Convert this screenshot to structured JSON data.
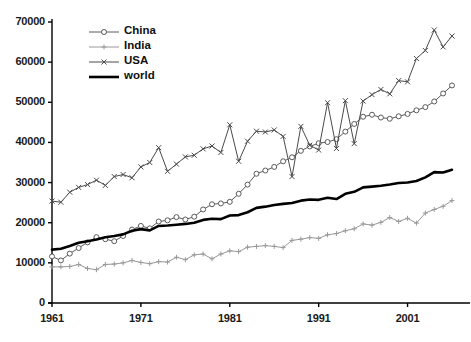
{
  "chart_data": {
    "type": "line",
    "title": "",
    "subtitle": "",
    "xlabel": "",
    "ylabel": "",
    "xlim": [
      1961,
      2006
    ],
    "ylim": [
      0,
      70000
    ],
    "grid": false,
    "legend_position": "top-left",
    "y_ticks": [
      0,
      10000,
      20000,
      30000,
      40000,
      50000,
      60000,
      70000
    ],
    "y_tick_labels": [
      "0",
      "10000",
      "20000",
      "30000",
      "40000",
      "50000",
      "60000",
      "70000"
    ],
    "x_ticks": [
      1961,
      1971,
      1981,
      1991,
      2001
    ],
    "x_tick_labels": [
      "1961",
      "1971",
      "1981",
      "1991",
      "2001"
    ],
    "x": [
      1961,
      1962,
      1963,
      1964,
      1965,
      1966,
      1967,
      1968,
      1969,
      1970,
      1971,
      1972,
      1973,
      1974,
      1975,
      1976,
      1977,
      1978,
      1979,
      1980,
      1981,
      1982,
      1983,
      1984,
      1985,
      1986,
      1987,
      1988,
      1989,
      1990,
      1991,
      1992,
      1993,
      1994,
      1995,
      1996,
      1997,
      1998,
      1999,
      2000,
      2001,
      2002,
      2003,
      2004,
      2005,
      2006
    ],
    "series": [
      {
        "name": "China",
        "marker": "circle-open",
        "color": "#5a5a5a",
        "line_width": 1,
        "values": [
          11600,
          10600,
          12300,
          13700,
          15100,
          16400,
          15900,
          15400,
          16700,
          18300,
          19200,
          18600,
          20300,
          20600,
          21400,
          20800,
          21500,
          23300,
          24600,
          24800,
          25200,
          27200,
          29500,
          32200,
          33000,
          33900,
          35300,
          36300,
          37900,
          39000,
          39800,
          40100,
          40800,
          42700,
          44600,
          46400,
          46900,
          46200,
          45900,
          46500,
          47100,
          48000,
          48800,
          50200,
          52200,
          54200
        ]
      },
      {
        "name": "India",
        "marker": "plus",
        "color": "#999999",
        "line_width": 1,
        "values": [
          9000,
          9000,
          9100,
          9600,
          8600,
          8300,
          9600,
          9700,
          10000,
          10600,
          10100,
          9800,
          10300,
          10200,
          11400,
          10800,
          12000,
          12200,
          11000,
          12200,
          13000,
          12800,
          13900,
          14100,
          14300,
          14100,
          13800,
          15600,
          15900,
          16300,
          16100,
          17000,
          17300,
          18000,
          18500,
          19700,
          19400,
          20100,
          21300,
          20300,
          21100,
          19900,
          22400,
          23300,
          24100,
          25500
        ]
      },
      {
        "name": "USA",
        "marker": "x",
        "color": "#4a4a4a",
        "line_width": 1,
        "values": [
          25400,
          25100,
          27600,
          28800,
          29500,
          30600,
          29300,
          31500,
          32000,
          31200,
          33900,
          35000,
          38700,
          32800,
          34600,
          36400,
          36800,
          38400,
          39100,
          37500,
          44400,
          35300,
          40300,
          42800,
          42600,
          43100,
          41500,
          31500,
          44000,
          39300,
          38100,
          49900,
          38500,
          50400,
          39700,
          50300,
          51900,
          53200,
          52100,
          55400,
          55100,
          60900,
          62900,
          68000,
          63800,
          66500
        ]
      },
      {
        "name": "world",
        "marker": "none",
        "color": "#000000",
        "line_width": 2.6,
        "values": [
          13300,
          13500,
          14200,
          15000,
          15400,
          15800,
          16400,
          16700,
          17100,
          18000,
          18400,
          18100,
          19200,
          19300,
          19500,
          19700,
          20000,
          20700,
          21000,
          20900,
          21800,
          21900,
          22600,
          23700,
          24000,
          24400,
          24700,
          24900,
          25500,
          25800,
          25700,
          26200,
          25900,
          27200,
          27700,
          28800,
          29000,
          29200,
          29500,
          29900,
          30000,
          30400,
          31300,
          32600,
          32500,
          33200
        ]
      }
    ]
  },
  "legend": {
    "items": [
      {
        "label": "China"
      },
      {
        "label": "India"
      },
      {
        "label": "USA"
      },
      {
        "label": "world"
      }
    ]
  }
}
